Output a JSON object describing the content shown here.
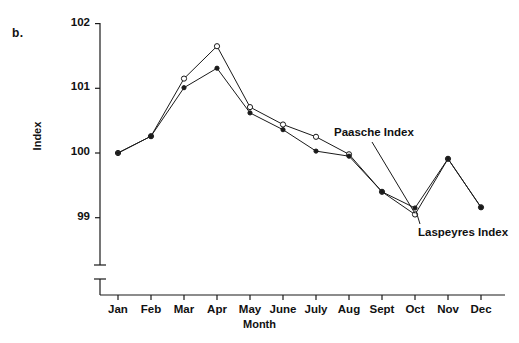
{
  "figure": {
    "panel_label": "b.",
    "background": "#ffffff",
    "ink_color": "#1a1a1a"
  },
  "labels": {
    "paasche": "Paasche Index",
    "laspeyres": "Laspeyres Index"
  },
  "chart_data": {
    "type": "line",
    "title": "",
    "xlabel": "Month",
    "ylabel": "Index",
    "categories": [
      "Jan",
      "Feb",
      "Mar",
      "Apr",
      "May",
      "June",
      "July",
      "Aug",
      "Sept",
      "Oct",
      "Nov",
      "Dec"
    ],
    "x_tick_labels": [
      "Jan",
      "Feb",
      "Mar",
      "Apr",
      "May",
      "June",
      "July",
      "Aug",
      "Sept",
      "Oct",
      "Nov",
      "Dec"
    ],
    "y_tick_labels": [
      "99",
      "100",
      "101",
      "102"
    ],
    "y_ticks": [
      99,
      100,
      101,
      102
    ],
    "ylim": [
      98.8,
      102
    ],
    "y_axis_break": true,
    "grid": false,
    "legend_position": "inline-annotation",
    "series": [
      {
        "name": "Paasche Index",
        "marker": "open-circle",
        "values": [
          100.0,
          100.26,
          101.15,
          101.65,
          100.71,
          100.44,
          100.25,
          99.98,
          99.4,
          99.05,
          99.91,
          99.16
        ]
      },
      {
        "name": "Laspeyres Index",
        "marker": "filled-circle",
        "values": [
          100.0,
          100.26,
          101.01,
          101.31,
          100.62,
          100.36,
          100.03,
          99.95,
          99.4,
          99.15,
          99.91,
          99.16
        ]
      }
    ],
    "annotations": [
      {
        "text": "Paasche Index",
        "points_to": "Oct"
      },
      {
        "text": "Laspeyres Index",
        "points_to": "Oct"
      }
    ]
  }
}
